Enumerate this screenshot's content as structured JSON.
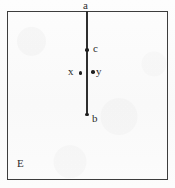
{
  "figure": {
    "caption": "",
    "background_color": "#fbfbfb",
    "ink_color": "#2e2e2e",
    "border_color": "#3d3d3d"
  },
  "region": {
    "label": "E",
    "shape": "rectangle",
    "bounds": {
      "left": 7,
      "top": 11,
      "width": 161,
      "height": 169
    }
  },
  "segment": {
    "name": "ab",
    "from_label": "a",
    "to_label": "b",
    "orientation": "vertical",
    "x": 86,
    "y_start": 11,
    "y_end": 114
  },
  "points": [
    {
      "id": "a",
      "label": "a",
      "x": 86,
      "y": 11,
      "marker": "none",
      "label_position": "above"
    },
    {
      "id": "c",
      "label": "c",
      "x": 86,
      "y": 49,
      "marker": "dot",
      "label_position": "right"
    },
    {
      "id": "b",
      "label": "b",
      "x": 86,
      "y": 114,
      "marker": "dot",
      "label_position": "right"
    },
    {
      "id": "x",
      "label": "x",
      "x": 80,
      "y": 72,
      "marker": "dot",
      "label_position": "left"
    },
    {
      "id": "y",
      "label": "y",
      "x": 93,
      "y": 71,
      "marker": "dot",
      "label_position": "right"
    }
  ],
  "labels": {
    "a": "a",
    "b": "b",
    "c": "c",
    "x": "x",
    "y": "y",
    "E": "E"
  }
}
